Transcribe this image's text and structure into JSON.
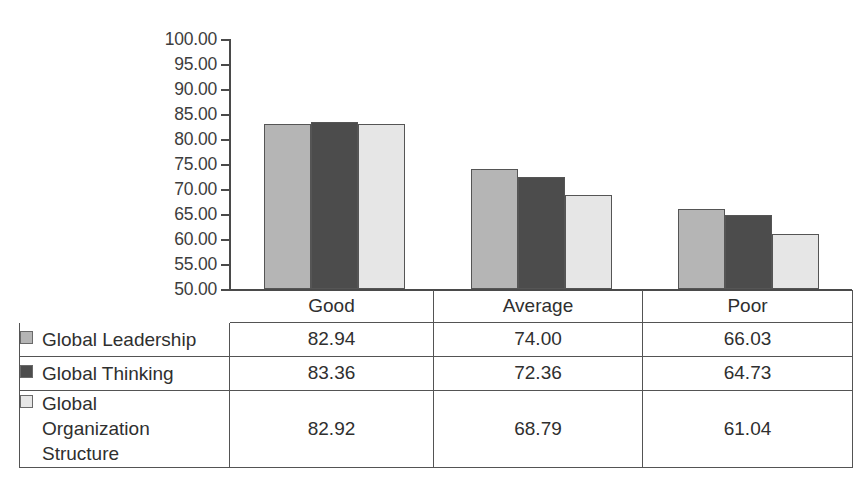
{
  "chart_data": {
    "type": "bar",
    "title": "",
    "subtitle": "",
    "xlabel": "",
    "ylabel": "",
    "categories": [
      "Good",
      "Average",
      "Poor"
    ],
    "series": [
      {
        "name": "Global Leadership",
        "values": [
          82.94,
          74.0,
          66.03
        ],
        "color": "#b5b5b5",
        "swatch_icon": "legend-square-medium-gray"
      },
      {
        "name": "Global Thinking",
        "values": [
          83.36,
          72.36,
          64.73
        ],
        "color": "#4c4c4c",
        "swatch_icon": "legend-square-dark-gray"
      },
      {
        "name": "Global Organization Structure",
        "values": [
          82.92,
          68.79,
          61.04
        ],
        "color": "#e6e6e6",
        "swatch_icon": "legend-square-light-gray"
      }
    ],
    "ylim": [
      50.0,
      100.0
    ],
    "ytick_step": 5.0,
    "ytick_labels": [
      "100.00",
      "95.00",
      "90.00",
      "85.00",
      "80.00",
      "75.00",
      "70.00",
      "65.00",
      "60.00",
      "55.00",
      "50.00"
    ],
    "ytick_values": [
      100,
      95,
      90,
      85,
      80,
      75,
      70,
      65,
      60,
      55,
      50
    ],
    "grid": false,
    "legend_position": "data-table-left-column",
    "axis_color": "#4a4a4a",
    "bar_border_color": "#555555",
    "background_color": "#ffffff"
  },
  "table": {
    "header": [
      "",
      "Good",
      "Average",
      "Poor"
    ],
    "rows": [
      {
        "label": "Global Leadership",
        "values": [
          "82.94",
          "74.00",
          "66.03"
        ]
      },
      {
        "label": "Global Thinking",
        "values": [
          "83.36",
          "72.36",
          "64.73"
        ]
      },
      {
        "label": "Global Organization Structure",
        "values": [
          "82.92",
          "68.79",
          "61.04"
        ]
      }
    ]
  }
}
